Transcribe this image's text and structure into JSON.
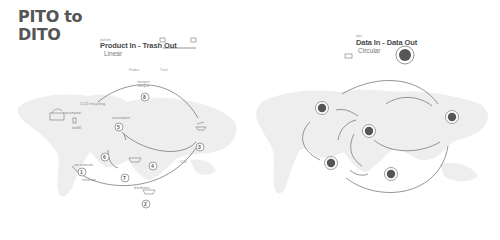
{
  "title": {
    "line1": "PITO to",
    "line2": "DITO"
  },
  "left_panel": {
    "eyebrow": "platform",
    "heading": "Product In - Trash Out",
    "subtitle": "Linear",
    "axis_start": "Product",
    "axis_end": "Trash",
    "labels": {
      "top_arc": "transport",
      "top_arc2": "Recycle",
      "co2": "CO2 recycling",
      "consumption": "consumption",
      "landfill": "landfill",
      "step5_label": "consumption",
      "step1_top": "raw materials",
      "step1_bottom": "extraction",
      "step2_label": "distribution",
      "step3_label": "production",
      "step4_label": "CO2"
    },
    "steps": [
      "1",
      "2",
      "3",
      "4",
      "5",
      "6",
      "7",
      "8"
    ]
  },
  "right_panel": {
    "eyebrow": "data",
    "heading": "Data In - Data Out",
    "subtitle": "Circular"
  },
  "colors": {
    "map": "#eeeeee",
    "line": "#7a7a7a",
    "node": "#555555",
    "text": "#4a4a4a"
  }
}
